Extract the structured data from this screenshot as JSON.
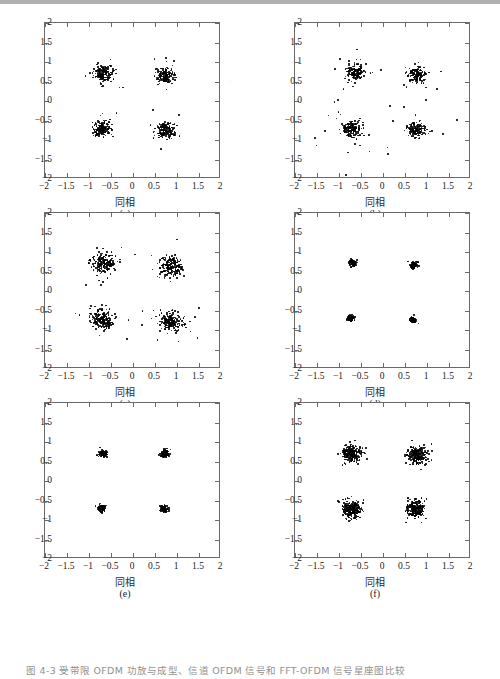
{
  "figure": {
    "caption": "图 4-3   受带限 OFDM 功放与成型、信道 OFDM 信号和 FFT-OFDM 信号星座图比较",
    "caption_visible_fragment": "图 4-3   受带限 OFDM 功放与成型、信道 OFDM 信号和 FFT-OFDM 信号星座图",
    "axis_color": "#6a6a6a",
    "point_color": "#000000",
    "background": "#ffffff"
  },
  "axes_common": {
    "xlabel": "同相",
    "ylabel": "正交",
    "xlim": [
      -2,
      2
    ],
    "ylim": [
      -2,
      2
    ],
    "xticks": [
      -2,
      -1.5,
      -1,
      -0.5,
      0,
      0.5,
      1,
      1.5,
      2
    ],
    "xticklabels": [
      "-2",
      "-1.5",
      "-1",
      "-0.5",
      "0",
      "0.5",
      "1",
      "1.5",
      "2"
    ],
    "yticks": [
      -2,
      -1.5,
      -1,
      -0.5,
      0,
      0.5,
      1,
      1.5,
      2
    ],
    "yticklabels": [
      "-2",
      "-1.5",
      "-1",
      "-0.5",
      "0",
      "0.5",
      "1",
      "1.5",
      "2"
    ],
    "grid": false,
    "box": true
  },
  "panels": [
    {
      "id": "a",
      "label": "(a)",
      "modulation": "QPSK",
      "n_points": 620,
      "spread": 0.105,
      "outlier_spread": 0.3,
      "outlier_fraction": 0.035,
      "seed": 11,
      "centers": [
        [
          -0.68,
          0.7
        ],
        [
          0.72,
          0.66
        ],
        [
          -0.7,
          -0.7
        ],
        [
          0.74,
          -0.74
        ]
      ]
    },
    {
      "id": "b",
      "label": "(b)",
      "modulation": "QPSK",
      "n_points": 620,
      "spread": 0.1,
      "outlier_spread": 0.36,
      "outlier_fraction": 0.07,
      "seed": 23,
      "centers": [
        [
          -0.64,
          0.74
        ],
        [
          0.76,
          0.66
        ],
        [
          -0.7,
          -0.72
        ],
        [
          0.74,
          -0.74
        ]
      ]
    },
    {
      "id": "c",
      "label": "(c)",
      "modulation": "QPSK",
      "n_points": 760,
      "spread": 0.13,
      "outlier_spread": 0.34,
      "outlier_fraction": 0.045,
      "seed": 37,
      "centers": [
        [
          -0.66,
          0.7
        ],
        [
          0.86,
          0.62
        ],
        [
          -0.7,
          -0.72
        ],
        [
          0.86,
          -0.8
        ]
      ]
    },
    {
      "id": "d",
      "label": "(d)",
      "modulation": "QPSK",
      "n_points": 420,
      "spread": 0.038,
      "outlier_spread": 0.09,
      "outlier_fraction": 0.012,
      "seed": 53,
      "centers": [
        [
          -0.68,
          0.72
        ],
        [
          0.7,
          0.66
        ],
        [
          -0.74,
          -0.7
        ],
        [
          0.68,
          -0.74
        ]
      ]
    },
    {
      "id": "e",
      "label": "(e)",
      "modulation": "QPSK",
      "n_points": 460,
      "spread": 0.042,
      "outlier_spread": 0.1,
      "outlier_fraction": 0.014,
      "seed": 71,
      "centers": [
        [
          -0.68,
          0.7
        ],
        [
          0.72,
          0.7
        ],
        [
          -0.72,
          -0.7
        ],
        [
          0.7,
          -0.72
        ]
      ]
    },
    {
      "id": "f",
      "label": "(f)",
      "modulation": "QPSK",
      "n_points": 900,
      "spread": 0.115,
      "outlier_spread": 0.22,
      "outlier_fraction": 0.02,
      "seed": 97,
      "centers": [
        [
          -0.72,
          0.7
        ],
        [
          0.78,
          0.68
        ],
        [
          -0.72,
          -0.72
        ],
        [
          0.74,
          -0.72
        ]
      ]
    }
  ],
  "chart_data": {
    "type": "scatter",
    "title": "",
    "xlabel": "同相",
    "ylabel": "正交",
    "xlim": [
      -2,
      2
    ],
    "ylim": [
      -2,
      2
    ],
    "grid": false,
    "legend": null,
    "subplots": [
      {
        "panel": "(a)",
        "description": "QPSK constellation, moderate AWGN",
        "cluster_centers": [
          [
            -0.68,
            0.7
          ],
          [
            0.72,
            0.66
          ],
          [
            -0.7,
            -0.7
          ],
          [
            0.74,
            -0.74
          ]
        ],
        "cluster_std": 0.105,
        "approx_points": 620
      },
      {
        "panel": "(b)",
        "description": "QPSK constellation, moderate AWGN with scattered outliers",
        "cluster_centers": [
          [
            -0.64,
            0.74
          ],
          [
            0.76,
            0.66
          ],
          [
            -0.7,
            -0.72
          ],
          [
            0.74,
            -0.74
          ]
        ],
        "cluster_std": 0.1,
        "approx_points": 620
      },
      {
        "panel": "(c)",
        "description": "QPSK constellation, larger spread / smeared clusters",
        "cluster_centers": [
          [
            -0.66,
            0.7
          ],
          [
            0.86,
            0.62
          ],
          [
            -0.7,
            -0.72
          ],
          [
            0.86,
            -0.8
          ]
        ],
        "cluster_std": 0.13,
        "approx_points": 760
      },
      {
        "panel": "(d)",
        "description": "QPSK constellation, very tight clusters (low noise)",
        "cluster_centers": [
          [
            -0.68,
            0.72
          ],
          [
            0.7,
            0.66
          ],
          [
            -0.74,
            -0.7
          ],
          [
            0.68,
            -0.74
          ]
        ],
        "cluster_std": 0.038,
        "approx_points": 420
      },
      {
        "panel": "(e)",
        "description": "QPSK constellation, very tight clusters (low noise)",
        "cluster_centers": [
          [
            -0.68,
            0.7
          ],
          [
            0.72,
            0.7
          ],
          [
            -0.72,
            -0.7
          ],
          [
            0.7,
            -0.72
          ]
        ],
        "cluster_std": 0.042,
        "approx_points": 460
      },
      {
        "panel": "(f)",
        "description": "QPSK constellation, dense round clusters",
        "cluster_centers": [
          [
            -0.72,
            0.7
          ],
          [
            0.78,
            0.68
          ],
          [
            -0.72,
            -0.72
          ],
          [
            0.74,
            -0.72
          ]
        ],
        "cluster_std": 0.115,
        "approx_points": 900
      }
    ]
  }
}
